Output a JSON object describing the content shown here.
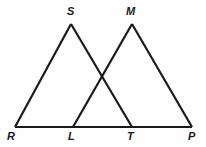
{
  "figure": {
    "type": "geometry-diagram",
    "background_color": "#fefefe",
    "stroke_color": "#1a1a1a",
    "label_color": "#1a1a1a",
    "stroke_width": 2.2
  },
  "points": {
    "R": {
      "label": "R",
      "x": 15,
      "y": 127,
      "label_x": 7,
      "label_y": 131
    },
    "L": {
      "label": "L",
      "x": 73,
      "y": 127,
      "label_x": 68,
      "label_y": 131
    },
    "T": {
      "label": "T",
      "x": 132,
      "y": 127,
      "label_x": 127,
      "label_y": 131
    },
    "P": {
      "label": "P",
      "x": 192,
      "y": 127,
      "label_x": 188,
      "label_y": 131
    },
    "S": {
      "label": "S",
      "x": 71,
      "y": 24,
      "label_x": 67,
      "label_y": 6
    },
    "M": {
      "label": "M",
      "x": 132,
      "y": 24,
      "label_x": 126,
      "label_y": 6
    }
  },
  "segments": [
    {
      "name": "base-RP",
      "from": "R",
      "to": "P",
      "x1": 15,
      "y1": 127,
      "x2": 192,
      "y2": 127
    },
    {
      "name": "side-RS",
      "from": "R",
      "to": "S",
      "x1": 15,
      "y1": 127,
      "x2": 71,
      "y2": 24
    },
    {
      "name": "side-ST",
      "from": "S",
      "to": "T",
      "x1": 71,
      "y1": 24,
      "x2": 132,
      "y2": 127
    },
    {
      "name": "side-LM",
      "from": "L",
      "to": "M",
      "x1": 73,
      "y1": 127,
      "x2": 132,
      "y2": 24
    },
    {
      "name": "side-MP",
      "from": "M",
      "to": "P",
      "x1": 132,
      "y1": 24,
      "x2": 192,
      "y2": 127
    }
  ],
  "triangles": [
    {
      "name": "triangle-RST",
      "vertices": [
        "R",
        "S",
        "T"
      ]
    },
    {
      "name": "triangle-LMP",
      "vertices": [
        "L",
        "M",
        "P"
      ]
    }
  ],
  "intersection": {
    "name": "crossing-point",
    "x": 102,
    "y": 78
  }
}
